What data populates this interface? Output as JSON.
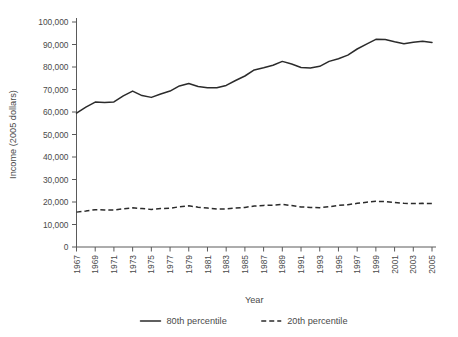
{
  "chart_data": {
    "type": "line",
    "title": "",
    "xlabel": "Year",
    "ylabel": "Income (2005 dollars)",
    "xlim": [
      1967,
      2005
    ],
    "ylim": [
      0,
      100000
    ],
    "grid": false,
    "legend_position": "bottom-center",
    "y_ticks": [
      0,
      10000,
      20000,
      30000,
      40000,
      50000,
      60000,
      70000,
      80000,
      90000,
      100000
    ],
    "y_tick_labels": [
      "0",
      "10,000",
      "20,000",
      "30,000",
      "40,000",
      "50,000",
      "60,000",
      "70,000",
      "80,000",
      "90,000",
      "100,000"
    ],
    "x_ticks": [
      1967,
      1969,
      1971,
      1973,
      1975,
      1977,
      1979,
      1981,
      1983,
      1985,
      1987,
      1989,
      1991,
      1993,
      1995,
      1997,
      1999,
      2001,
      2003,
      2005
    ],
    "x_tick_labels": [
      "1967",
      "1969",
      "1971",
      "1973",
      "1975",
      "1977",
      "1979",
      "1981",
      "1983",
      "1985",
      "1987",
      "1989",
      "1991",
      "1993",
      "1995",
      "1997",
      "1999",
      "2001",
      "2003",
      "2005"
    ],
    "x": [
      1967,
      1968,
      1969,
      1970,
      1971,
      1972,
      1973,
      1974,
      1975,
      1976,
      1977,
      1978,
      1979,
      1980,
      1981,
      1982,
      1983,
      1984,
      1985,
      1986,
      1987,
      1988,
      1989,
      1990,
      1991,
      1992,
      1993,
      1994,
      1995,
      1996,
      1997,
      1998,
      1999,
      2000,
      2001,
      2002,
      2003,
      2004,
      2005
    ],
    "series": [
      {
        "name": "80th percentile",
        "style": "solid",
        "color": "#2b2b2b",
        "values": [
          59500,
          62200,
          64400,
          64200,
          64500,
          67200,
          69300,
          67300,
          66500,
          68000,
          69300,
          71600,
          72700,
          71300,
          70800,
          70800,
          71800,
          74000,
          76000,
          78700,
          79700,
          80800,
          82500,
          81300,
          79800,
          79600,
          80300,
          82500,
          83700,
          85300,
          88000,
          90200,
          92300,
          92200,
          91200,
          90300,
          91000,
          91400,
          90900
        ]
      },
      {
        "name": "20th percentile",
        "style": "dashed",
        "color": "#2b2b2b",
        "values": [
          15500,
          16000,
          16600,
          16500,
          16400,
          17000,
          17400,
          17100,
          16700,
          17100,
          17200,
          17900,
          18300,
          17700,
          17300,
          16900,
          16900,
          17300,
          17600,
          18200,
          18500,
          18600,
          18900,
          18400,
          17800,
          17600,
          17500,
          17900,
          18500,
          18800,
          19400,
          19900,
          20300,
          20200,
          19800,
          19400,
          19300,
          19400,
          19300
        ]
      }
    ]
  },
  "legend": {
    "items": [
      {
        "label": "80th percentile",
        "style": "solid"
      },
      {
        "label": "20th percentile",
        "style": "dashed"
      }
    ]
  }
}
